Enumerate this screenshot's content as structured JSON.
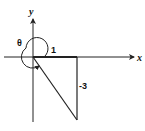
{
  "diagram": {
    "type": "coordinate-plane-angle",
    "axes": {
      "x_label": "x",
      "y_label": "y"
    },
    "angle_label": "θ",
    "triangle": {
      "horizontal_leg_label": "1",
      "vertical_leg_label": "-3"
    },
    "point": {
      "x": 1,
      "y": -3
    },
    "colors": {
      "stroke": "#222222",
      "background": "#ffffff"
    }
  }
}
